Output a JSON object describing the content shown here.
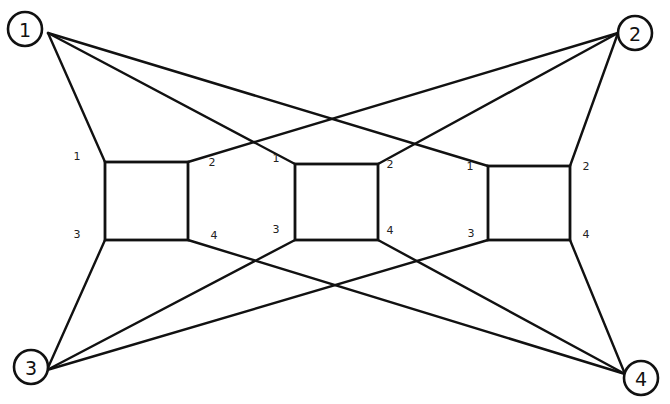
{
  "diagram": {
    "type": "network-graph",
    "background": "#ffffff",
    "stroke_color": "#111111",
    "outer_nodes": [
      {
        "id": "1",
        "label": "1",
        "cx": 25,
        "cy": 29,
        "r": 17,
        "anchor": [
          48,
          33
        ]
      },
      {
        "id": "2",
        "label": "2",
        "cx": 635,
        "cy": 33,
        "r": 17,
        "anchor": [
          618,
          33
        ]
      },
      {
        "id": "3",
        "label": "3",
        "cx": 31,
        "cy": 367,
        "r": 17,
        "anchor": [
          47,
          370
        ]
      },
      {
        "id": "4",
        "label": "4",
        "cx": 641,
        "cy": 378,
        "r": 17,
        "anchor": [
          625,
          374
        ]
      }
    ],
    "boxes": [
      {
        "id": "box-a",
        "x1": 105,
        "y1": 162,
        "x2": 188,
        "y2": 240,
        "ports": {
          "1": {
            "label": "1",
            "lx": 77,
            "ly": 156
          },
          "2": {
            "label": "2",
            "lx": 212,
            "ly": 162
          },
          "3": {
            "label": "3",
            "lx": 77,
            "ly": 234
          },
          "4": {
            "label": "4",
            "lx": 214,
            "ly": 235
          }
        }
      },
      {
        "id": "box-b",
        "x1": 295,
        "y1": 164,
        "x2": 378,
        "y2": 240,
        "ports": {
          "1": {
            "label": "1",
            "lx": 276,
            "ly": 158
          },
          "2": {
            "label": "2",
            "lx": 390,
            "ly": 164
          },
          "3": {
            "label": "3",
            "lx": 276,
            "ly": 229
          },
          "4": {
            "label": "4",
            "lx": 390,
            "ly": 230
          }
        }
      },
      {
        "id": "box-c",
        "x1": 488,
        "y1": 166,
        "x2": 570,
        "y2": 240,
        "ports": {
          "1": {
            "label": "1",
            "lx": 470,
            "ly": 166
          },
          "2": {
            "label": "2",
            "lx": 586,
            "ly": 166
          },
          "3": {
            "label": "3",
            "lx": 471,
            "ly": 233
          },
          "4": {
            "label": "4",
            "lx": 586,
            "ly": 234
          }
        }
      }
    ],
    "edges": [
      {
        "from": "1",
        "to": "box-a",
        "port": "1"
      },
      {
        "from": "1",
        "to": "box-b",
        "port": "1"
      },
      {
        "from": "1",
        "to": "box-c",
        "port": "1"
      },
      {
        "from": "2",
        "to": "box-a",
        "port": "2"
      },
      {
        "from": "2",
        "to": "box-b",
        "port": "2"
      },
      {
        "from": "2",
        "to": "box-c",
        "port": "2"
      },
      {
        "from": "3",
        "to": "box-a",
        "port": "3"
      },
      {
        "from": "3",
        "to": "box-b",
        "port": "3"
      },
      {
        "from": "3",
        "to": "box-c",
        "port": "3"
      },
      {
        "from": "4",
        "to": "box-a",
        "port": "4"
      },
      {
        "from": "4",
        "to": "box-b",
        "port": "4"
      },
      {
        "from": "4",
        "to": "box-c",
        "port": "4"
      }
    ]
  }
}
